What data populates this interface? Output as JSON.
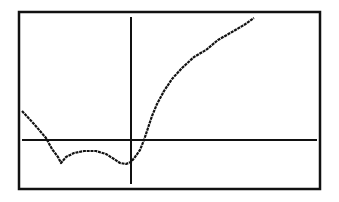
{
  "chart_data": {
    "type": "line",
    "title": "",
    "xlabel": "",
    "ylabel": "",
    "grid": false,
    "legend": null,
    "frame": {
      "left": 19,
      "top": 12,
      "right": 320,
      "bottom": 189
    },
    "axes": {
      "y_axis_x": 131,
      "y_axis_top": 17,
      "y_axis_bottom": 184,
      "x_axis_y": 140,
      "x_axis_left": 22,
      "x_axis_right": 317
    },
    "series": [
      {
        "name": "f(x)",
        "color": "#111111",
        "points_px": [
          [
            22,
            111
          ],
          [
            34,
            124
          ],
          [
            46,
            138
          ],
          [
            52,
            149
          ],
          [
            58,
            157
          ],
          [
            61,
            163
          ],
          [
            66,
            157
          ],
          [
            74,
            153
          ],
          [
            84,
            151
          ],
          [
            96,
            151
          ],
          [
            106,
            154
          ],
          [
            114,
            159
          ],
          [
            120,
            163
          ],
          [
            126,
            164
          ],
          [
            131,
            162
          ],
          [
            135,
            157
          ],
          [
            140,
            150
          ],
          [
            144,
            140
          ],
          [
            148,
            128
          ],
          [
            152,
            116
          ],
          [
            157,
            104
          ],
          [
            164,
            91
          ],
          [
            172,
            79
          ],
          [
            182,
            68
          ],
          [
            194,
            57
          ],
          [
            206,
            50
          ],
          [
            218,
            40
          ],
          [
            232,
            32
          ],
          [
            244,
            25
          ],
          [
            254,
            18
          ]
        ]
      }
    ],
    "description": "Graphing-calculator style plot: curve descends from upper-left, crosses x-axis left of origin, has a local min, small hump, another min just left of the y-axis, then rises steeply crossing x-axis right of origin and levels off toward upper right."
  },
  "colors": {
    "background": "#ffffff",
    "ink": "#111111"
  }
}
